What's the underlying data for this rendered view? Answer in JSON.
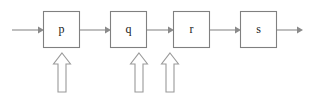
{
  "diagram": {
    "type": "pipeline-flow-diagram",
    "title": "",
    "canvas": {
      "width": 314,
      "height": 95,
      "background": "#ffffff"
    },
    "style": {
      "box_stroke": "#808080",
      "box_fill": "#ffffff",
      "line_stroke": "#8a8a8a",
      "block_arrow_stroke": "#9a9a9a",
      "block_arrow_fill": "#ffffff",
      "label_color": "#1a1a1a"
    },
    "nodes": [
      {
        "id": "p",
        "label": "p",
        "x": 43,
        "y": 11,
        "width": 37,
        "height": 37
      },
      {
        "id": "q",
        "label": "q",
        "x": 110,
        "y": 11,
        "width": 37,
        "height": 37
      },
      {
        "id": "r",
        "label": "r",
        "x": 173,
        "y": 11,
        "width": 37,
        "height": 37
      },
      {
        "id": "s",
        "label": "s",
        "x": 240,
        "y": 11,
        "width": 37,
        "height": 37
      }
    ],
    "flow_arrows": [
      {
        "id": "input-to-p",
        "from": "input",
        "to": "p",
        "x1": 12,
        "x2": 43,
        "y": 30
      },
      {
        "id": "p-to-q",
        "from": "p",
        "to": "q",
        "x1": 80,
        "x2": 110,
        "y": 30
      },
      {
        "id": "q-to-r",
        "from": "q",
        "to": "r",
        "x1": 147,
        "x2": 173,
        "y": 30
      },
      {
        "id": "r-to-s",
        "from": "r",
        "to": "s",
        "x1": 210,
        "x2": 240,
        "y": 30
      },
      {
        "id": "s-to-output",
        "from": "s",
        "to": "output",
        "x1": 277,
        "x2": 303,
        "y": 30
      }
    ],
    "block_arrows": [
      {
        "id": "block-arrow-under-p",
        "target": "p",
        "center_x": 62,
        "tip_y": 53,
        "tail_y": 92
      },
      {
        "id": "block-arrow-under-q",
        "target": "q",
        "center_x": 139,
        "tip_y": 53,
        "tail_y": 92
      },
      {
        "id": "block-arrow-under-r",
        "target": "r",
        "center_x": 170,
        "tip_y": 53,
        "tail_y": 92
      }
    ]
  }
}
